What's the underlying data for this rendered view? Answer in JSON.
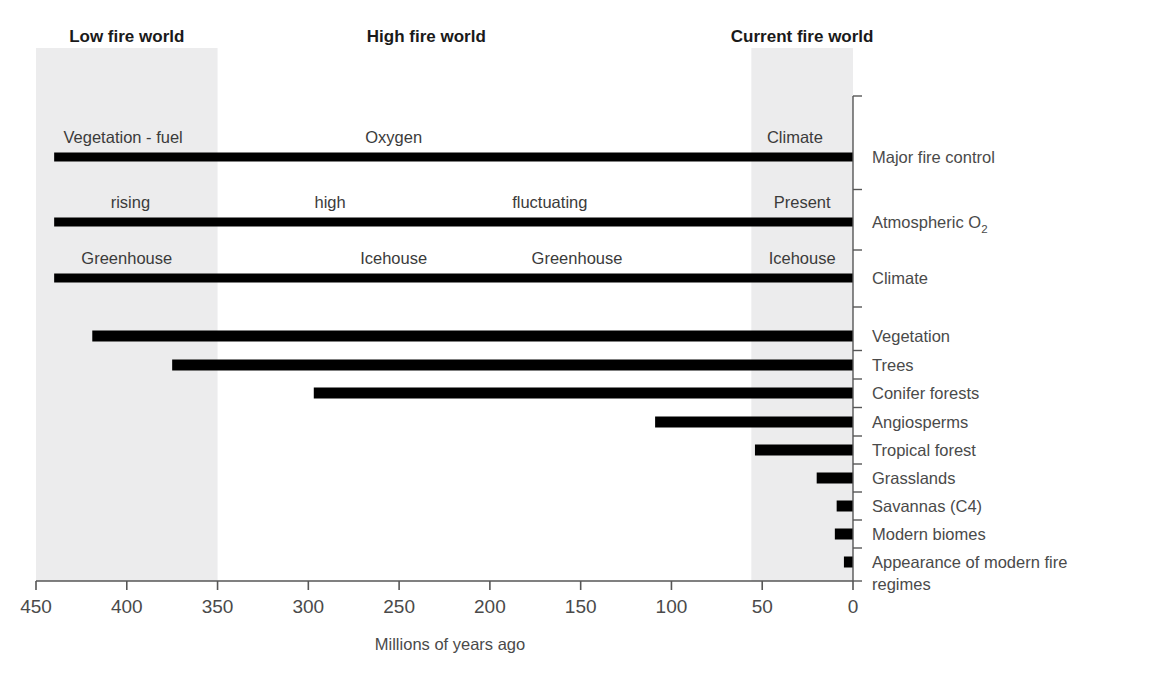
{
  "chart_data": {
    "type": "bar",
    "title": "",
    "xlabel": "Millions of years ago",
    "ylabel": "",
    "xlim": [
      450,
      0
    ],
    "x_reversed": true,
    "grid": false,
    "legend": "none",
    "x_ticks": [
      450,
      400,
      350,
      300,
      250,
      200,
      150,
      100,
      50,
      0
    ],
    "x_tick_labels": [
      "450",
      "400",
      "350",
      "300",
      "250",
      "200",
      "150",
      "100",
      "50",
      "0"
    ],
    "eras": [
      {
        "name": "Low fire world",
        "start": 450,
        "end": 350,
        "shaded": true,
        "label_x": 400
      },
      {
        "name": "High fire world",
        "start": 350,
        "end": 56,
        "shaded": false,
        "label_x": 235
      },
      {
        "name": "Current fire world",
        "start": 56,
        "end": 0,
        "shaded": true,
        "label_x": 28
      }
    ],
    "rows": [
      {
        "label": "Major fire control",
        "label_sub": "",
        "bar_start": 440,
        "bar_end": 0,
        "segments": [
          {
            "text": "Vegetation - fuel",
            "center": 402
          },
          {
            "text": "Oxygen",
            "center": 253
          },
          {
            "text": "Climate",
            "center": 32
          }
        ]
      },
      {
        "label": "Atmospheric O",
        "label_sub": "2",
        "bar_start": 440,
        "bar_end": 0,
        "segments": [
          {
            "text": "rising",
            "center": 398
          },
          {
            "text": "high",
            "center": 288
          },
          {
            "text": "fluctuating",
            "center": 167
          },
          {
            "text": "Present",
            "center": 28
          }
        ]
      },
      {
        "label": "Climate",
        "label_sub": "",
        "bar_start": 440,
        "bar_end": 0,
        "segments": [
          {
            "text": "Greenhouse",
            "center": 400
          },
          {
            "text": "Icehouse",
            "center": 253
          },
          {
            "text": "Greenhouse",
            "center": 152
          },
          {
            "text": "Icehouse",
            "center": 28
          }
        ]
      },
      {
        "label": "Vegetation",
        "label_sub": "",
        "bar_start": 419,
        "bar_end": 0,
        "segments": []
      },
      {
        "label": "Trees",
        "label_sub": "",
        "bar_start": 375,
        "bar_end": 0,
        "segments": []
      },
      {
        "label": "Conifer forests",
        "label_sub": "",
        "bar_start": 297,
        "bar_end": 0,
        "segments": []
      },
      {
        "label": "Angiosperms",
        "label_sub": "",
        "bar_start": 109,
        "bar_end": 0,
        "segments": []
      },
      {
        "label": "Tropical forest",
        "label_sub": "",
        "bar_start": 54,
        "bar_end": 0,
        "segments": []
      },
      {
        "label": "Grasslands",
        "label_sub": "",
        "bar_start": 20,
        "bar_end": 0,
        "segments": []
      },
      {
        "label": "Savannas (C4)",
        "label_sub": "",
        "bar_start": 9,
        "bar_end": 0,
        "segments": []
      },
      {
        "label": "Modern biomes",
        "label_sub": "",
        "bar_start": 10,
        "bar_end": 0,
        "segments": []
      },
      {
        "label": "Appearance of modern fire",
        "label_sub": "",
        "label_line2": "regimes",
        "bar_start": 5,
        "bar_end": 0,
        "segments": []
      }
    ],
    "colors": {
      "bar": "#000000",
      "band": "#ececed",
      "text": "#4a4a4a",
      "header_text": "#1a1a1a",
      "axis": "#565656",
      "background": "#ffffff"
    }
  },
  "layout": {
    "plot_left_px": 36,
    "plot_right_px": 853,
    "bar_rows_y": [
      157,
      222,
      278,
      336,
      365,
      393,
      422,
      450,
      478,
      506,
      534,
      562
    ],
    "bar_thickness_px": 9,
    "thin_bar_thickness_px": 11,
    "band_top_px": 48,
    "band_bottom_px": 581,
    "axis_y_px": 581,
    "header_y_px": 42,
    "tick_label_y_px": 604,
    "axis_title_y_px": 650,
    "axis_title_x_px": 450,
    "label_x_px": 872,
    "spine_x_px": 853
  }
}
